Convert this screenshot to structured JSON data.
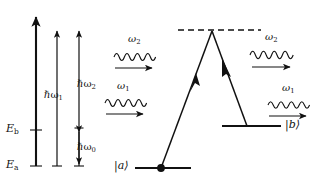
{
  "figure": {
    "name": "three-level-lambda-energy-diagram",
    "background_color": "#ffffff",
    "stroke_color": "#111111",
    "width": 333,
    "height": 190
  },
  "energy_axis": {
    "levels": [
      {
        "id": "E_b",
        "symbol": "E",
        "subscript": "b",
        "y": 130
      },
      {
        "id": "E_a",
        "symbol": "E",
        "subscript": "a",
        "y": 166
      }
    ],
    "arrows": [
      {
        "id": "hbar-omega-big",
        "x": 36,
        "top_y": 14,
        "bottom_y": 166,
        "thick": true,
        "label": ""
      },
      {
        "id": "hbar-omega-1",
        "x": 57,
        "top_y": 28,
        "bottom_y": 166,
        "thick": false,
        "label": "hw1"
      },
      {
        "id": "hbar-omega-2",
        "x": 79,
        "top_y": 28,
        "bottom_y": 166,
        "thick": false,
        "label": "hw2"
      }
    ],
    "labels": {
      "hbar_omega_1": {
        "hbar": "ℏω",
        "sub": "1",
        "x": 57,
        "y": 96
      },
      "hbar_omega_2": {
        "hbar": "ℏω",
        "sub": "2",
        "x": 79,
        "y": 86
      },
      "hbar_omega_0": {
        "hbar": "ℏω",
        "sub": "0",
        "x": 77,
        "y": 147
      }
    }
  },
  "photon_arrows": [
    {
      "id": "omega-2-left",
      "symbol": "ω",
      "sub": "2",
      "label_x": 131,
      "label_y": 40,
      "wave_x": 114,
      "wave_y": 57,
      "wave_w": 42,
      "arrow_y": 68
    },
    {
      "id": "omega-1-left",
      "symbol": "ω",
      "sub": "1",
      "label_x": 120,
      "label_y": 88,
      "wave_x": 105,
      "wave_y": 103,
      "wave_w": 42,
      "arrow_y": 114
    },
    {
      "id": "omega-2-right",
      "symbol": "ω",
      "sub": "2",
      "label_x": 268,
      "label_y": 38,
      "wave_x": 250,
      "wave_y": 55,
      "wave_w": 44,
      "arrow_y": 67
    },
    {
      "id": "omega-1-right",
      "symbol": "ω",
      "sub": "1",
      "label_x": 285,
      "label_y": 90,
      "wave_x": 268,
      "wave_y": 105,
      "wave_w": 42,
      "arrow_y": 116
    }
  ],
  "transition_diagram": {
    "virtual_level": {
      "id": "dashed-virtual-level",
      "x1": 178,
      "x2": 261,
      "y": 30
    },
    "apex": {
      "x": 212,
      "y": 31
    },
    "state_a": {
      "ket": "|a⟩",
      "label_x": 118,
      "label_y": 163,
      "line_x1": 135,
      "line_x2": 191,
      "line_y": 168,
      "dot_x": 161,
      "dot_y": 168
    },
    "state_b": {
      "ket": "|b⟩",
      "label_x": 285,
      "label_y": 122,
      "line_x1": 222,
      "line_x2": 281,
      "line_y": 126
    },
    "legs": [
      {
        "id": "absorption-leg",
        "x1": 161,
        "y1": 168,
        "x2": 212,
        "y2": 31,
        "arrow_at": 0.5
      },
      {
        "id": "emission-leg",
        "x1": 212,
        "y1": 31,
        "x2": 247,
        "y2": 126,
        "arrow_at": 0.42
      }
    ]
  }
}
